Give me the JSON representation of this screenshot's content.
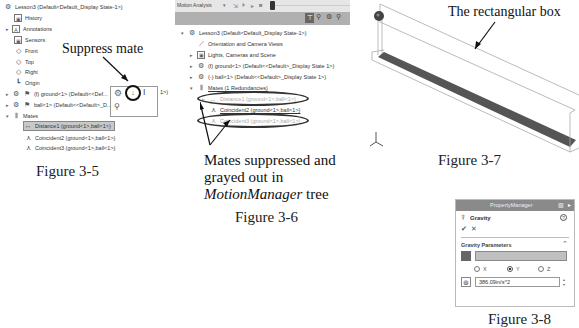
{
  "figure_3_5": {
    "caption": "Figure 3-5",
    "annotation": "Suppress mate",
    "tree": [
      {
        "icon": "assembly-icon",
        "glyph": "⚙",
        "label": "Lesson3  (Default<Default_Display State-1>)",
        "expander": ""
      },
      {
        "icon": "history-icon",
        "glyph": "▣",
        "label": "History",
        "expander": ""
      },
      {
        "icon": "annotations-icon",
        "glyph": "A",
        "label": "Annotations",
        "expander": "▸"
      },
      {
        "icon": "sensors-icon",
        "glyph": "▣",
        "label": "Sensors",
        "expander": ""
      },
      {
        "icon": "plane-icon",
        "glyph": "◇",
        "label": "Front",
        "expander": ""
      },
      {
        "icon": "plane-icon",
        "glyph": "◇",
        "label": "Top",
        "expander": ""
      },
      {
        "icon": "plane-icon",
        "glyph": "◇",
        "label": "Right",
        "expander": ""
      },
      {
        "icon": "origin-icon",
        "glyph": "┗",
        "label": "Origin",
        "expander": ""
      },
      {
        "icon": "part-icon",
        "glyph": "⚙",
        "label": "(f) ground<1> (Default<<Def...",
        "expander": "▸"
      },
      {
        "icon": "part-icon",
        "glyph": "⚙",
        "label": "ball<1> (Default<<Default>_D...",
        "expander": "▸"
      },
      {
        "icon": "mates-icon",
        "glyph": "⫴",
        "label": "Mates",
        "expander": "▾"
      },
      {
        "icon": "distance-mate-icon",
        "glyph": "↔",
        "label": "Distance1 (ground<1>,ball<1>)",
        "expander": "",
        "selected": true
      },
      {
        "icon": "coincident-mate-icon",
        "glyph": "⋏",
        "label": "Coincident2 (ground<1>,ball<1>)",
        "expander": ""
      },
      {
        "icon": "coincident-mate-icon",
        "glyph": "⋏",
        "label": "Coincident3 (ground<1>,ball<1>)",
        "expander": ""
      }
    ],
    "context_toolbar_trailing": "1>)"
  },
  "figure_3_6": {
    "caption": "Figure 3-6",
    "toolbar": {
      "study_type": "Motion Analysis"
    },
    "annotation_line1": "Mates suppressed and",
    "annotation_line2": "grayed out in",
    "annotation_line3_italic": "MotionManager",
    "annotation_line3_rest": " tree",
    "tree": [
      {
        "icon": "assembly-icon",
        "glyph": "⚙",
        "label": "Lesson3  (Default<Default_Display State-1>)",
        "expander": "▾",
        "indent": 0
      },
      {
        "icon": "camera-views-icon",
        "glyph": "⟋",
        "label": "Orientation and Camera Views",
        "expander": "",
        "indent": 1
      },
      {
        "icon": "lights-icon",
        "glyph": "▣",
        "label": "Lights, Cameras and Scene",
        "expander": "▸",
        "indent": 1
      },
      {
        "icon": "part-icon",
        "glyph": "⚙",
        "label": "(f) ground<1> (Default<<Default>_Display State 1>)",
        "expander": "▸",
        "indent": 1
      },
      {
        "icon": "part-icon",
        "glyph": "⚙",
        "label": "(-) ball<1> (Default<<Default>_Display State 1>)",
        "expander": "▸",
        "indent": 1
      },
      {
        "icon": "mates-icon",
        "glyph": "⫴",
        "label": "Mates (1 Redundancies)",
        "expander": "▾",
        "indent": 1
      },
      {
        "icon": "distance-mate-icon",
        "glyph": "↔",
        "label": "Distance1 (ground<1>,ball<1>)",
        "expander": "▸",
        "indent": 2,
        "grayed": true
      },
      {
        "icon": "coincident-mate-icon",
        "glyph": "⋏",
        "label": "Coincident2 (ground<1>,ball<1>)",
        "expander": "",
        "indent": 2
      },
      {
        "icon": "coincident-mate-icon",
        "glyph": "⋏",
        "label": "Coincident3 (ground<1>,ball<1>)",
        "expander": "",
        "indent": 2,
        "grayed": true
      }
    ]
  },
  "figure_3_7": {
    "caption": "Figure 3-7",
    "annotation": "The rectangular box"
  },
  "figure_3_8": {
    "caption": "Figure 3-8",
    "panel_title": "PropertyManager",
    "feature_name": "Gravity",
    "ok_glyph": "✔",
    "cancel_glyph": "✕",
    "help_glyph": "?",
    "section_title": "Gravity Parameters",
    "radios": [
      {
        "label": "X",
        "selected": false
      },
      {
        "label": "Y",
        "selected": true
      },
      {
        "label": "Z",
        "selected": false
      }
    ],
    "value": "386.09in/s^2"
  },
  "colors": {
    "toolbar_bg": "#b0b0b0",
    "panel_header_bg": "#8a8a8a",
    "selected_row_bg": "#c8c8c8",
    "box_floor": "#555555",
    "direction_field": "#c0c0c0"
  }
}
